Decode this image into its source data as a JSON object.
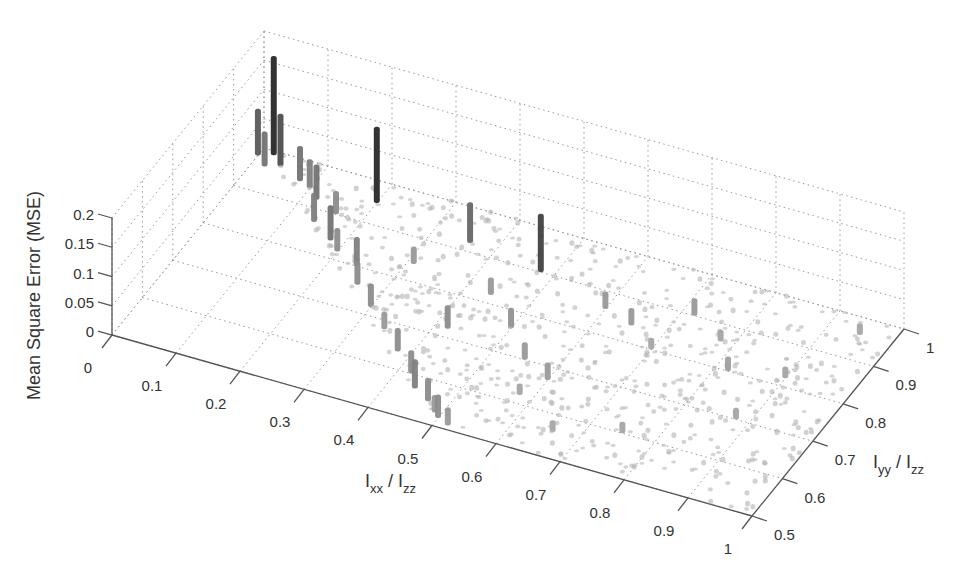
{
  "chart_data": {
    "type": "scatter",
    "subtype": "3d-stem-bars",
    "title": "",
    "xlabel": "I_xx / I_zz",
    "ylabel": "I_yy / I_zz",
    "zlabel": "Mean Square Error (MSE)",
    "xlim": [
      0,
      1
    ],
    "ylim": [
      0.5,
      1
    ],
    "zlim": [
      0,
      0.2
    ],
    "x_ticks": [
      "0",
      "0.1",
      "0.2",
      "0.3",
      "0.4",
      "0.5",
      "0.6",
      "0.7",
      "0.8",
      "0.9",
      "1"
    ],
    "y_ticks": [
      "0.5",
      "0.6",
      "0.7",
      "0.8",
      "0.9",
      "1"
    ],
    "z_ticks": [
      "0",
      "0.05",
      "0.1",
      "0.15",
      "0.2"
    ],
    "grid": true,
    "colormap": "grayscale (dark = high MSE)",
    "data_region": "x + y >= 1, 0.5 <= y <= 1, 0 <= x <= 1",
    "notable_points": [
      {
        "x": 0.02,
        "y": 0.99,
        "z": 0.17
      },
      {
        "x": 0.0,
        "y": 0.98,
        "z": 0.08
      },
      {
        "x": 0.04,
        "y": 0.97,
        "z": 0.09
      },
      {
        "x": 0.02,
        "y": 0.96,
        "z": 0.06
      },
      {
        "x": 0.08,
        "y": 0.95,
        "z": 0.06
      },
      {
        "x": 0.1,
        "y": 0.94,
        "z": 0.05
      },
      {
        "x": 0.12,
        "y": 0.92,
        "z": 0.06
      },
      {
        "x": 0.2,
        "y": 0.95,
        "z": 0.13
      },
      {
        "x": 0.16,
        "y": 0.9,
        "z": 0.04
      },
      {
        "x": 0.14,
        "y": 0.87,
        "z": 0.05
      },
      {
        "x": 0.18,
        "y": 0.84,
        "z": 0.06
      },
      {
        "x": 0.2,
        "y": 0.82,
        "z": 0.04
      },
      {
        "x": 0.24,
        "y": 0.8,
        "z": 0.05
      },
      {
        "x": 0.26,
        "y": 0.76,
        "z": 0.04
      },
      {
        "x": 0.3,
        "y": 0.72,
        "z": 0.04
      },
      {
        "x": 0.34,
        "y": 0.68,
        "z": 0.03
      },
      {
        "x": 0.38,
        "y": 0.64,
        "z": 0.04
      },
      {
        "x": 0.42,
        "y": 0.6,
        "z": 0.04
      },
      {
        "x": 0.44,
        "y": 0.57,
        "z": 0.05
      },
      {
        "x": 0.47,
        "y": 0.55,
        "z": 0.04
      },
      {
        "x": 0.49,
        "y": 0.53,
        "z": 0.03
      },
      {
        "x": 0.5,
        "y": 0.52,
        "z": 0.04
      },
      {
        "x": 0.52,
        "y": 0.51,
        "z": 0.03
      },
      {
        "x": 0.36,
        "y": 0.92,
        "z": 0.07
      },
      {
        "x": 0.48,
        "y": 0.9,
        "z": 0.1
      },
      {
        "x": 0.31,
        "y": 0.84,
        "z": 0.03
      },
      {
        "x": 0.44,
        "y": 0.82,
        "z": 0.03
      },
      {
        "x": 0.5,
        "y": 0.76,
        "z": 0.035
      },
      {
        "x": 0.42,
        "y": 0.72,
        "z": 0.04
      },
      {
        "x": 0.55,
        "y": 0.7,
        "z": 0.03
      },
      {
        "x": 0.6,
        "y": 0.67,
        "z": 0.03
      },
      {
        "x": 0.6,
        "y": 0.86,
        "z": 0.03
      },
      {
        "x": 0.65,
        "y": 0.84,
        "z": 0.03
      },
      {
        "x": 0.7,
        "y": 0.8,
        "z": 0.02
      },
      {
        "x": 0.72,
        "y": 0.9,
        "z": 0.03
      },
      {
        "x": 0.78,
        "y": 0.86,
        "z": 0.02
      },
      {
        "x": 0.82,
        "y": 0.8,
        "z": 0.025
      },
      {
        "x": 0.9,
        "y": 0.82,
        "z": 0.02
      },
      {
        "x": 0.95,
        "y": 0.96,
        "z": 0.02
      },
      {
        "x": 0.88,
        "y": 0.7,
        "z": 0.02
      },
      {
        "x": 0.75,
        "y": 0.6,
        "z": 0.02
      },
      {
        "x": 0.66,
        "y": 0.56,
        "z": 0.02
      },
      {
        "x": 0.58,
        "y": 0.62,
        "z": 0.02
      }
    ]
  }
}
